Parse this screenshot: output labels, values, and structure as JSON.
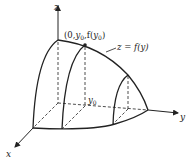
{
  "diagram": {
    "axes": {
      "x_label": "x",
      "y_label": "y",
      "z_label": "z"
    },
    "point_label": {
      "open": "(0,",
      "y": "y",
      "sub0": "0",
      "comma_f": ",f(",
      "y2": "y",
      "sub0b": "0",
      "close": ")"
    },
    "curve_label": "z = f(y)",
    "y0_label": {
      "main": "y",
      "sub": "0"
    },
    "colors": {
      "line": "#222222",
      "background": "#ffffff"
    }
  }
}
